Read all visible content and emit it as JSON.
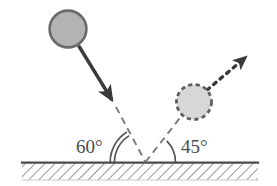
{
  "diagram": {
    "type": "physics-vector-diagram",
    "canvas": {
      "width": 277,
      "height": 186
    },
    "colors": {
      "incoming_ball_fill": "#b3b3b3",
      "incoming_ball_stroke": "#6a6a6a",
      "outgoing_ball_fill": "#d7d7d7",
      "outgoing_ball_stroke": "#5f5f5f",
      "vector_stroke": "#3a3a3a",
      "dashed_stroke": "#7a7a7a",
      "ground_stroke": "#4a4a4a",
      "hatch_stroke": "#9a9a9a",
      "label_text": "#4d4d4d",
      "background": "#ffffff"
    },
    "labels": {
      "incidence_angle": "60°",
      "reflection_angle": "45°"
    },
    "angle_values": {
      "incidence_degrees": 60,
      "reflection_degrees": 45
    },
    "objects": {
      "incoming_ball": {
        "name": "incoming-ball",
        "cx": 68,
        "cy": 29,
        "r": 19,
        "border_style": "solid"
      },
      "outgoing_ball": {
        "name": "outgoing-ball",
        "cx": 194,
        "cy": 102,
        "r": 18,
        "border_style": "dashed"
      },
      "impact_point": {
        "x": 145,
        "y": 162
      }
    },
    "vectors": {
      "incoming": {
        "name": "incoming-velocity-vector",
        "style": "solid",
        "from": {
          "x": 79,
          "y": 46
        },
        "to": {
          "x": 114,
          "y": 104
        },
        "arrowhead": "end"
      },
      "incoming_extension": {
        "name": "incoming-dashed-extension",
        "style": "dashed",
        "from": {
          "x": 116,
          "y": 108
        },
        "to": {
          "x": 145,
          "y": 162
        }
      },
      "outgoing_dashed": {
        "name": "outgoing-dashed-segment",
        "style": "dashed",
        "from": {
          "x": 145,
          "y": 162
        },
        "to": {
          "x": 182,
          "y": 114
        }
      },
      "outgoing": {
        "name": "outgoing-velocity-vector",
        "style": "dotted",
        "from": {
          "x": 207,
          "y": 89
        },
        "to": {
          "x": 250,
          "y": 53
        },
        "arrowhead": "end"
      }
    },
    "arcs": {
      "incidence_arc": {
        "name": "incidence-angle-arc",
        "lines": 2
      },
      "reflection_arc": {
        "name": "reflection-angle-arc",
        "lines": 1
      }
    },
    "ground": {
      "name": "ground-surface",
      "x_start": 22,
      "x_end": 258,
      "top_y": 162,
      "bottom_y": 180,
      "hatch_direction": "up-right"
    }
  }
}
